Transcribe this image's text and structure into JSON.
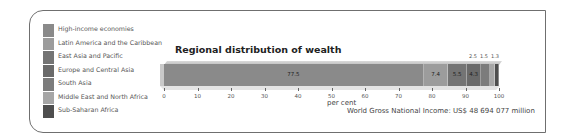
{
  "chart_data": {
    "type": "bar",
    "subtype": "stacked-horizontal-100",
    "title": "Regional distribution of wealth",
    "xlabel": "per cent",
    "ylabel": "",
    "xlim": [
      0,
      100
    ],
    "x_ticks": [
      "0",
      "10",
      "20",
      "30",
      "40",
      "50",
      "60",
      "70",
      "80",
      "90",
      "100"
    ],
    "categories": [
      "High-income economies",
      "Latin America and the Caribbean",
      "East Asia and Pacific",
      "Europe and Central Asia",
      "South Asia",
      "Middle East and North Africa",
      "Sub-Saharan Africa"
    ],
    "values": [
      77.5,
      7.4,
      5.5,
      4.3,
      2.5,
      1.5,
      1.3
    ],
    "value_labels": [
      "77.5",
      "7.4",
      "5.5",
      "4.3",
      "2.5",
      "1.5",
      "1.3"
    ],
    "colors": [
      "#8a8a8a",
      "#9c9c9c",
      "#747474",
      "#6a6a6a",
      "#7c7c7c",
      "#a6a6a6",
      "#4e4e4e"
    ],
    "legend_position": "left",
    "grid": false,
    "annotation": "World Gross National Income: US$ 48 694 077 million"
  },
  "legend": {
    "items": [
      {
        "label": "High-income economies",
        "color": "#8a8a8a"
      },
      {
        "label": "Latin America and the Caribbean",
        "color": "#9c9c9c"
      },
      {
        "label": "East Asia and Pacific",
        "color": "#747474"
      },
      {
        "label": "Europe and Central Asia",
        "color": "#6a6a6a"
      },
      {
        "label": "South Asia",
        "color": "#7c7c7c"
      },
      {
        "label": "Middle East and North Africa",
        "color": "#a6a6a6"
      },
      {
        "label": "Sub-Saharan Africa",
        "color": "#4e4e4e"
      }
    ]
  }
}
